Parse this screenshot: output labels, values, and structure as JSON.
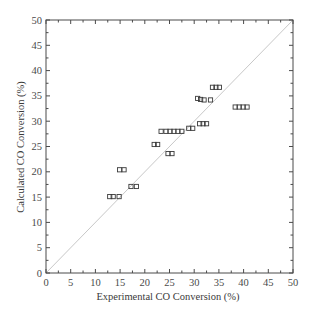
{
  "chart_data": {
    "type": "scatter",
    "title": "",
    "xlabel": "Experimental CO Conversion (%)",
    "ylabel": "Calculated CO Conversion (%)",
    "xlim": [
      0,
      50
    ],
    "ylim": [
      0,
      50
    ],
    "xticks": [
      0,
      5,
      10,
      15,
      20,
      25,
      30,
      35,
      40,
      45,
      50
    ],
    "yticks": [
      0,
      5,
      10,
      15,
      20,
      25,
      30,
      35,
      40,
      45,
      50
    ],
    "minor_tick_step": 2.5,
    "grid": false,
    "legend": null,
    "reference_line": {
      "type": "parity",
      "from": [
        0,
        0
      ],
      "to": [
        50,
        50
      ],
      "color": "#c8c8c8"
    },
    "marker": {
      "shape": "open-square",
      "color": "#3a3a3a"
    },
    "series": [
      {
        "name": "Data",
        "points": [
          [
            12.9,
            15.1
          ],
          [
            13.6,
            15.1
          ],
          [
            14.8,
            15.1
          ],
          [
            14.9,
            20.4
          ],
          [
            15.8,
            20.4
          ],
          [
            17.2,
            17.1
          ],
          [
            18.3,
            17.1
          ],
          [
            21.9,
            25.4
          ],
          [
            22.6,
            25.4
          ],
          [
            23.3,
            28.0
          ],
          [
            24.3,
            28.0
          ],
          [
            25.1,
            28.0
          ],
          [
            25.9,
            28.0
          ],
          [
            26.7,
            28.0
          ],
          [
            27.5,
            28.0
          ],
          [
            24.7,
            23.6
          ],
          [
            25.5,
            23.6
          ],
          [
            28.9,
            28.6
          ],
          [
            29.7,
            28.6
          ],
          [
            31.1,
            29.5
          ],
          [
            31.8,
            29.5
          ],
          [
            32.5,
            29.5
          ],
          [
            30.7,
            34.5
          ],
          [
            31.3,
            34.3
          ],
          [
            32.0,
            34.2
          ],
          [
            33.3,
            34.2
          ],
          [
            33.7,
            36.7
          ],
          [
            34.4,
            36.7
          ],
          [
            35.1,
            36.7
          ],
          [
            38.3,
            32.8
          ],
          [
            39.1,
            32.8
          ],
          [
            39.9,
            32.8
          ],
          [
            40.7,
            32.8
          ]
        ]
      }
    ]
  }
}
